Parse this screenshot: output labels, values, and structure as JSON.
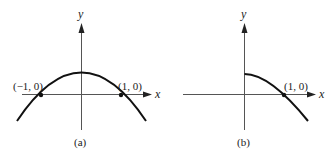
{
  "figure": {
    "panels": [
      {
        "caption": "(a)",
        "x_axis_label": "x",
        "y_axis_label": "y",
        "points": [
          {
            "label": "(−1, 0)",
            "x": -1,
            "y": 0
          },
          {
            "label": "(1, 0)",
            "x": 1,
            "y": 0
          }
        ],
        "curve_description": "downward-opening parabola symmetric about y-axis, crossing x-axis at x = -1 and x = 1"
      },
      {
        "caption": "(b)",
        "x_axis_label": "x",
        "y_axis_label": "y",
        "points": [
          {
            "label": "(1, 0)",
            "x": 1,
            "y": 0
          }
        ],
        "curve_description": "right half of downward-opening parabola starting at y-axis, crossing x-axis at x = 1"
      }
    ]
  },
  "colors": {
    "curve": "#111111",
    "axis": "#555555",
    "background": "#ffffff"
  }
}
